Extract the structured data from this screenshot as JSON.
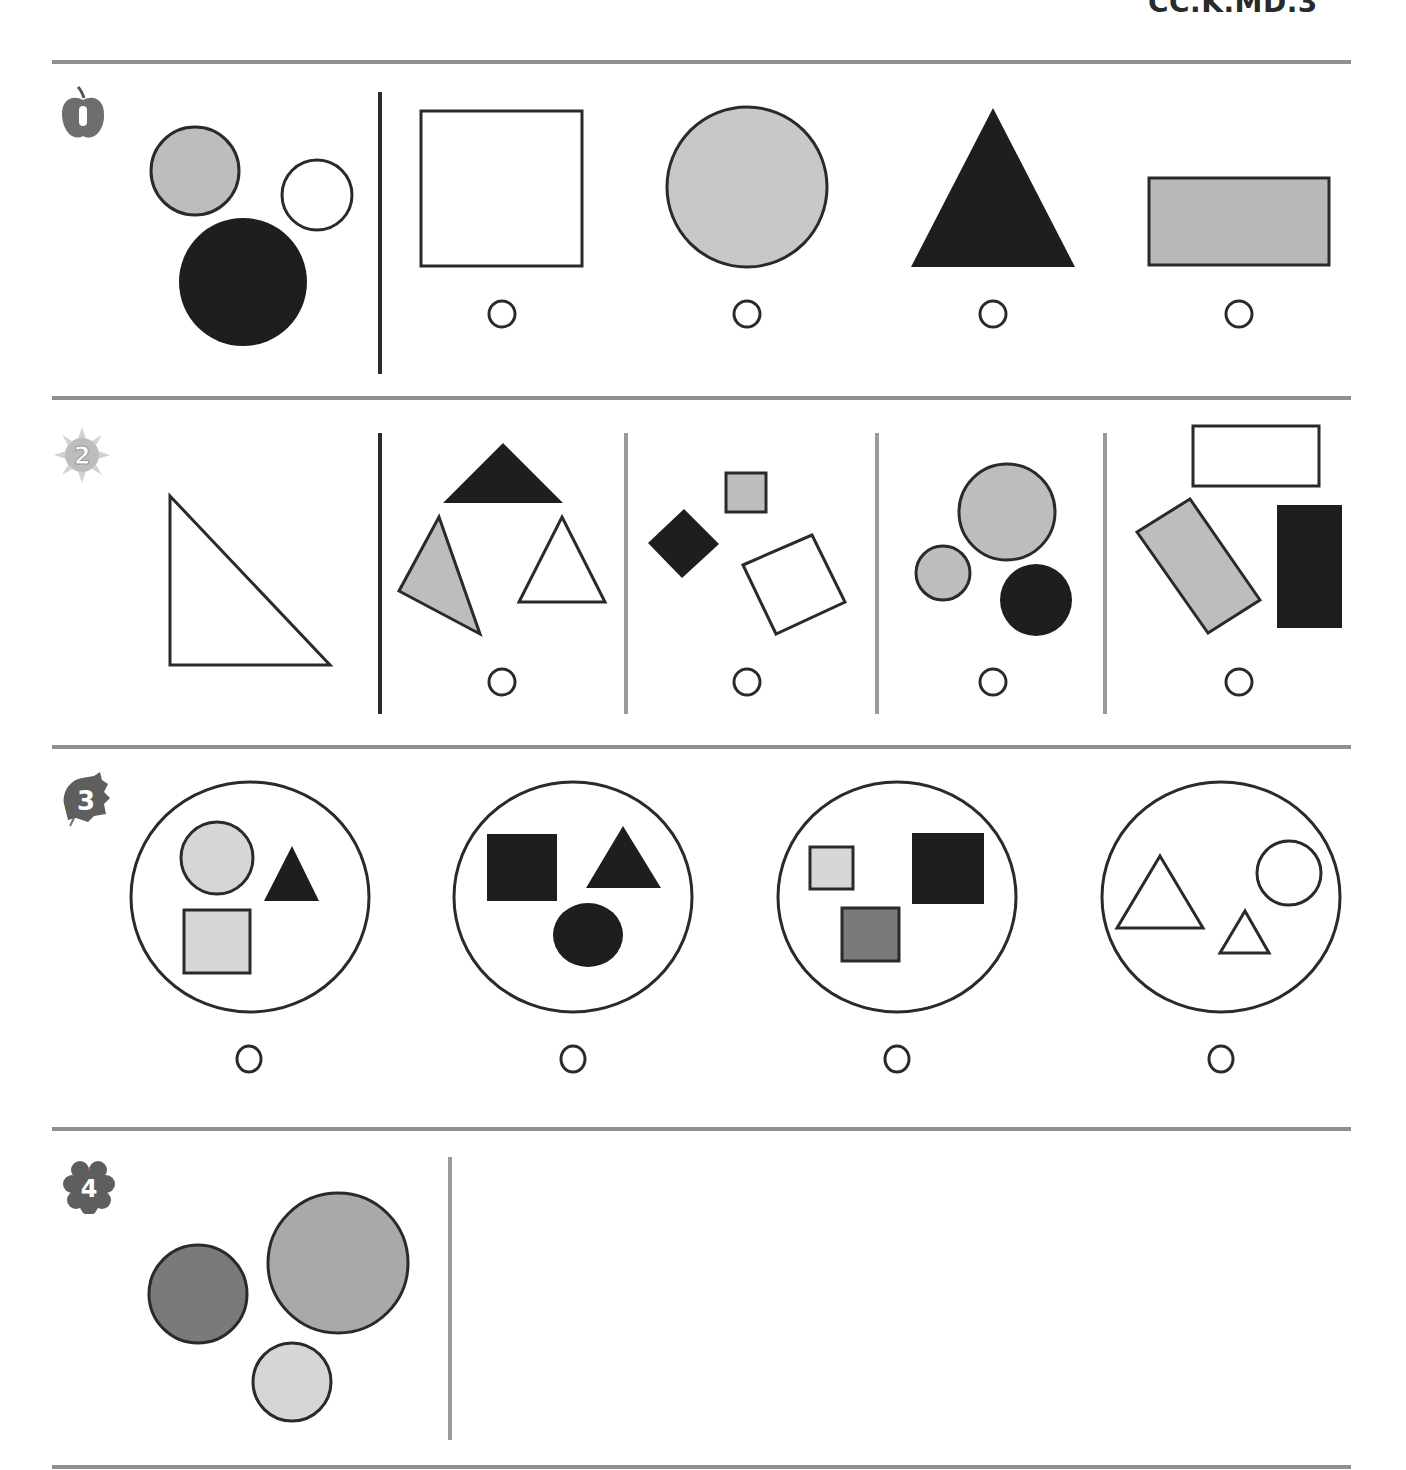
{
  "header": {
    "standard_code": "CC.K.MD.3"
  },
  "colors": {
    "rule": "#8f8f8f",
    "divider_dark": "#2b2b2b",
    "divider_gray": "#9a9a9a",
    "stroke": "#2a2a2a",
    "black_fill": "#1e1e1e",
    "gray_fill": "#bdbdbd",
    "light_fill": "#d6d6d6",
    "mid_fill": "#a9a9a9",
    "dark_fill": "#7a7a7a"
  },
  "questions": [
    {
      "number": "1",
      "badge_icon": "apple-icon",
      "prompt_shapes": [
        "gray circle",
        "white circle",
        "black circle"
      ],
      "choices": [
        {
          "shape": "white square"
        },
        {
          "shape": "gray circle"
        },
        {
          "shape": "black triangle"
        },
        {
          "shape": "gray rectangle"
        }
      ]
    },
    {
      "number": "2",
      "badge_icon": "sun-icon",
      "prompt_shapes": [
        "white right triangle"
      ],
      "choices": [
        {
          "shape": "group of triangles (black, gray, white)"
        },
        {
          "shape": "group of squares (black, gray, white)"
        },
        {
          "shape": "group of circles (gray, gray, black)"
        },
        {
          "shape": "group of rectangles (white, gray, black)"
        }
      ]
    },
    {
      "number": "3",
      "badge_icon": "leaf-icon",
      "prompt_shapes": [],
      "choices": [
        {
          "shape": "gray circle, gray square, black triangle"
        },
        {
          "shape": "black square, black triangle, black circle"
        },
        {
          "shape": "light square, dark gray square, black square"
        },
        {
          "shape": "white triangle, white triangle, white circle"
        }
      ]
    },
    {
      "number": "4",
      "badge_icon": "flower-icon",
      "prompt_shapes": [
        "dark gray circle",
        "gray circle",
        "light gray circle"
      ],
      "choices": []
    }
  ]
}
